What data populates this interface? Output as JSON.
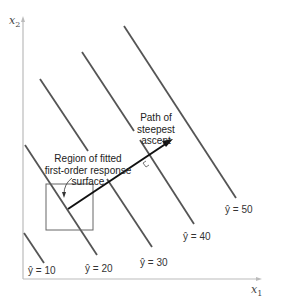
{
  "axes": {
    "x_label": "x",
    "x_sub": "1",
    "y_label": "x",
    "y_sub": "2"
  },
  "contours": [
    {
      "label": "ŷ = 10",
      "value": 10
    },
    {
      "label": "ŷ = 20",
      "value": 20
    },
    {
      "label": "ŷ = 30",
      "value": 30
    },
    {
      "label": "ŷ = 40",
      "value": 40
    },
    {
      "label": "ŷ = 50",
      "value": 50
    }
  ],
  "annotations": {
    "path": [
      "Path of",
      "steepest",
      "ascent"
    ],
    "region": [
      "Region of fitted",
      "first-order response",
      "surface"
    ]
  },
  "colors": {
    "contour": "#555555",
    "arrow": "#111111",
    "axis": "#bbbbbb",
    "box": "#666666"
  }
}
